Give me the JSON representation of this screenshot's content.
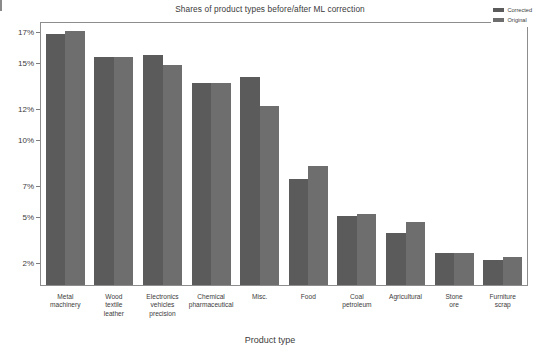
{
  "chart_data": {
    "type": "bar",
    "title": "Shares of product types before/after ML correction",
    "xlabel": "Product type",
    "ylabel": "",
    "grid": false,
    "legend_position": "top-right",
    "ylim": [
      0.6,
      17.6
    ],
    "ytick_values": [
      17,
      15,
      12,
      10,
      7,
      5,
      2
    ],
    "ytick_labels": [
      "17%",
      "15%",
      "12%",
      "10%",
      "7%",
      "5%",
      "2%"
    ],
    "categories": [
      "Metal machinery",
      "Wood textile leather",
      "Electronics vehicles precision",
      "Chemical pharmaceutical",
      "Misc.",
      "Food",
      "Coal petroleum",
      "Agricultural",
      "Stone ore",
      "Furniture scrap"
    ],
    "category_lines": [
      [
        "Metal",
        "machinery"
      ],
      [
        "Wood",
        "textile",
        "leather"
      ],
      [
        "Electronics",
        "vehicles",
        "precision"
      ],
      [
        "Chemical",
        "pharmaceutical"
      ],
      [
        "Misc."
      ],
      [
        "Food"
      ],
      [
        "Coal",
        "petroleum"
      ],
      [
        "Agricultural"
      ],
      [
        "Stone",
        "ore"
      ],
      [
        "Furniture",
        "scrap"
      ]
    ],
    "series": [
      {
        "name": "Corrected",
        "color": "#5b5b5b",
        "values": [
          16.9,
          15.4,
          15.5,
          13.7,
          14.1,
          7.5,
          5.1,
          4.0,
          2.7,
          2.2
        ]
      },
      {
        "name": "Original",
        "color": "#6e6e6e",
        "values": [
          17.1,
          15.4,
          14.9,
          13.7,
          12.2,
          8.3,
          5.2,
          4.7,
          2.7,
          2.4
        ]
      }
    ]
  },
  "legend": {
    "items": [
      {
        "label": "Corrected",
        "swatch_class": "corrected"
      },
      {
        "label": "Original",
        "swatch_class": "original"
      }
    ]
  }
}
